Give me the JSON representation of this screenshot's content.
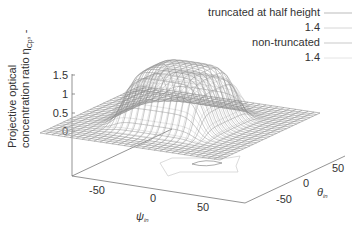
{
  "chart_data": {
    "type": "surface3d",
    "title": "",
    "zlabel": "Projective optical concentration ratio η_Cp, -",
    "zlabel_line1": "Projective optical",
    "zlabel_line2": "concentration ratio η",
    "zlabel_sub": "Cp",
    "zlabel_tail": ", -",
    "xlabel": "ψ",
    "xlabel_sub": "in",
    "ylabel": "θ",
    "ylabel_sub": "in",
    "zlim": [
      0,
      1.5
    ],
    "xlim": [
      -90,
      90
    ],
    "ylim": [
      -90,
      90
    ],
    "z_ticks": [
      "1.5",
      "1",
      "0.5",
      "0"
    ],
    "x_ticks": [
      "-50",
      "0",
      "50"
    ],
    "y_ticks": [
      "-50",
      "0",
      "50"
    ],
    "legend_position": "top-right",
    "series": [
      {
        "name": "truncated at half height",
        "style": "wireframe",
        "color": "#999999",
        "plateau_height": 1.2
      },
      {
        "name": "1.4",
        "style": "contour",
        "color": "#bbbbbb",
        "level": 1.4
      },
      {
        "name": "non-truncated",
        "style": "wireframe",
        "color": "#666666",
        "plateau_height": 1.5
      },
      {
        "name": "1.4",
        "style": "contour",
        "color": "#cccccc",
        "level": 1.4
      }
    ]
  },
  "legend": {
    "items": [
      {
        "label": "truncated at half height",
        "color": "#999999"
      },
      {
        "label": "1.4",
        "color": "#bbbbbb"
      },
      {
        "label": "non-truncated",
        "color": "#888888"
      },
      {
        "label": "1.4",
        "color": "#cccccc"
      }
    ]
  }
}
